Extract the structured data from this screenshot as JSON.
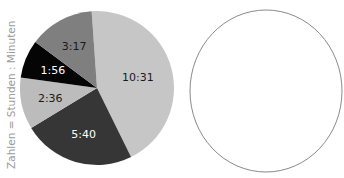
{
  "chart_data": [
    {
      "type": "pie",
      "title": "",
      "axis_note": "Zahlen = Stunden : Minuten",
      "unit": "hours:minutes",
      "start_angle_deg": -4,
      "direction": "clockwise",
      "slices": [
        {
          "label": "10:31",
          "minutes": 631,
          "color": "#c6c6c6",
          "text_color": "#1a1a1a"
        },
        {
          "label": "5:40",
          "minutes": 340,
          "color": "#363636",
          "text_color": "#ffffff"
        },
        {
          "label": "2:36",
          "minutes": 156,
          "color": "#bcbcbc",
          "text_color": "#1a1a1a"
        },
        {
          "label": "1:56",
          "minutes": 116,
          "color": "#050505",
          "text_color": "#ffffff"
        },
        {
          "label": "3:17",
          "minutes": 197,
          "color": "#7f7f7f",
          "text_color": "#1a1a1a"
        }
      ],
      "total_minutes": 1440
    },
    {
      "type": "pie",
      "title": "",
      "slices": [],
      "note": "empty circle outline"
    }
  ]
}
